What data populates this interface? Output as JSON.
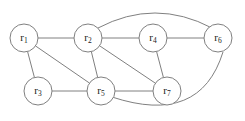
{
  "figure": {
    "kind": "undirected-graph",
    "background_color": "#ffffff",
    "stroke_color": "#808080",
    "label_color": "#1a1a1a",
    "width": 245,
    "height": 121
  },
  "nodes": [
    {
      "id": "r1",
      "base": "r",
      "subscript": "1",
      "cx": 24,
      "cy": 38,
      "r": 14
    },
    {
      "id": "r2",
      "base": "r",
      "subscript": "2",
      "cx": 88,
      "cy": 38,
      "r": 14
    },
    {
      "id": "r3",
      "base": "r",
      "subscript": "3",
      "cx": 38,
      "cy": 91,
      "r": 14
    },
    {
      "id": "r4",
      "base": "r",
      "subscript": "4",
      "cx": 153,
      "cy": 38,
      "r": 14
    },
    {
      "id": "r5",
      "base": "r",
      "subscript": "5",
      "cx": 101,
      "cy": 91,
      "r": 14
    },
    {
      "id": "r6",
      "base": "r",
      "subscript": "6",
      "cx": 218,
      "cy": 38,
      "r": 14
    },
    {
      "id": "r7",
      "base": "r",
      "subscript": "7",
      "cx": 167,
      "cy": 91,
      "r": 14
    }
  ],
  "edges": [
    {
      "from": "r1",
      "to": "r2",
      "shape": "straight"
    },
    {
      "from": "r1",
      "to": "r3",
      "shape": "straight"
    },
    {
      "from": "r1",
      "to": "r5",
      "shape": "straight"
    },
    {
      "from": "r2",
      "to": "r4",
      "shape": "straight"
    },
    {
      "from": "r2",
      "to": "r5",
      "shape": "straight"
    },
    {
      "from": "r2",
      "to": "r7",
      "shape": "straight"
    },
    {
      "from": "r3",
      "to": "r5",
      "shape": "straight"
    },
    {
      "from": "r4",
      "to": "r6",
      "shape": "straight"
    },
    {
      "from": "r4",
      "to": "r7",
      "shape": "straight"
    },
    {
      "from": "r5",
      "to": "r7",
      "shape": "straight"
    },
    {
      "from": "r2",
      "to": "r6",
      "shape": "arc",
      "path": "M 98 28 Q 155 -2 212 28"
    },
    {
      "from": "r5",
      "to": "r6",
      "shape": "arc",
      "path": "M 112 97 Q 200 126 223 52"
    }
  ]
}
